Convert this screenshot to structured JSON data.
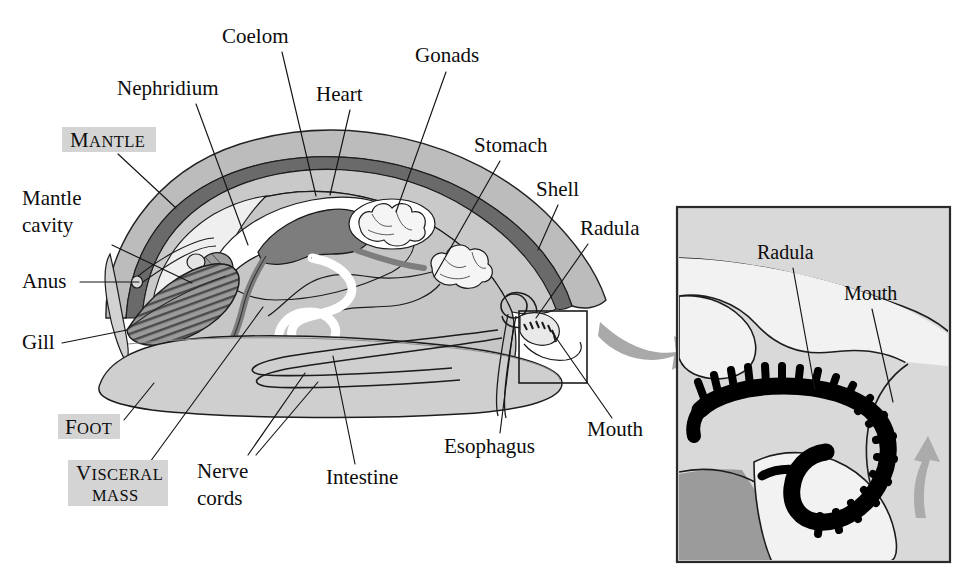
{
  "figure": {
    "background": "#ffffff"
  },
  "palette": {
    "ink": "#141414",
    "shell_band": "#b9b9b9",
    "shell_line": "#6e6e6e",
    "mantle_fill": "#cfcfcf",
    "visceral_fill": "#c6c6c6",
    "foot_fill": "#cfcfcf",
    "cavity_fill": "#ededed",
    "heart_fill": "#7d7d7d",
    "gill_fill": "#9a9a9a",
    "white": "#ffffff",
    "arrow_gray": "#a6a6a6",
    "inset_bg": "#d9d9d9",
    "inset_light": "#f0f0f0",
    "inset_dark": "#9b9b9b",
    "radula_black": "#000000",
    "highlight_box": "#d4d4d4"
  },
  "main_diagram": {
    "name": "mollusc-cutaway",
    "labels": [
      {
        "id": "coelom",
        "text": "Coelom",
        "x": 222,
        "y": 43,
        "anchor": "start",
        "leader": [
          [
            282,
            52
          ],
          [
            316,
            196
          ]
        ]
      },
      {
        "id": "nephridium",
        "text": "Nephridium",
        "x": 117,
        "y": 95,
        "anchor": "start",
        "leader": [
          [
            196,
            104
          ],
          [
            248,
            245
          ]
        ]
      },
      {
        "id": "heart",
        "text": "Heart",
        "x": 316,
        "y": 101,
        "anchor": "start",
        "leader": [
          [
            350,
            110
          ],
          [
            330,
            195
          ]
        ]
      },
      {
        "id": "gonads",
        "text": "Gonads",
        "x": 415,
        "y": 62,
        "anchor": "start",
        "leader": [
          [
            446,
            72
          ],
          [
            396,
            212
          ]
        ]
      },
      {
        "id": "stomach",
        "text": "Stomach",
        "x": 474,
        "y": 152,
        "anchor": "start",
        "leader": [
          [
            500,
            161
          ],
          [
            434,
            277
          ]
        ]
      },
      {
        "id": "shell",
        "text": "Shell",
        "x": 536,
        "y": 196,
        "anchor": "start",
        "leader": [
          [
            558,
            205
          ],
          [
            538,
            250
          ]
        ]
      },
      {
        "id": "radula",
        "text": "Radula",
        "x": 580,
        "y": 235,
        "anchor": "start",
        "leader": [
          [
            588,
            244
          ],
          [
            536,
            318
          ]
        ]
      },
      {
        "id": "mantle_cavity",
        "text": "Mantle",
        "text2": "cavity",
        "x": 22,
        "y": 205,
        "anchor": "start",
        "leader": [
          [
            112,
            245
          ],
          [
            192,
            283
          ]
        ]
      },
      {
        "id": "anus",
        "text": "Anus",
        "x": 22,
        "y": 288,
        "anchor": "start",
        "leader": [
          [
            80,
            282
          ],
          [
            136,
            282
          ]
        ]
      },
      {
        "id": "gill",
        "text": "Gill",
        "x": 22,
        "y": 349,
        "anchor": "start",
        "leader": [
          [
            62,
            343
          ],
          [
            126,
            329
          ]
        ]
      },
      {
        "id": "nerve_cords",
        "text": "Nerve",
        "text2": "cords",
        "x": 197,
        "y": 478,
        "anchor": "start",
        "leader": [
          [
            248,
            455
          ],
          [
            305,
            375
          ]
        ]
      },
      {
        "id": "intestine",
        "text": "Intestine",
        "x": 326,
        "y": 484,
        "anchor": "start",
        "leader": [
          [
            355,
            464
          ],
          [
            333,
            358
          ]
        ]
      },
      {
        "id": "esophagus",
        "text": "Esophagus",
        "x": 444,
        "y": 453,
        "anchor": "start",
        "leader": [
          [
            500,
            433
          ],
          [
            516,
            323
          ]
        ]
      },
      {
        "id": "mouth",
        "text": "Mouth",
        "x": 587,
        "y": 436,
        "anchor": "start",
        "leader": [
          [
            612,
            418
          ],
          [
            548,
            330
          ]
        ]
      }
    ],
    "region_labels": [
      {
        "id": "mantle",
        "lines": [
          "MANTLE"
        ],
        "box": {
          "x": 62,
          "y": 127,
          "w": 94,
          "h": 25
        },
        "leader": [
          [
            118,
            154
          ],
          [
            175,
            208
          ]
        ]
      },
      {
        "id": "foot",
        "lines": [
          "FOOT"
        ],
        "box": {
          "x": 58,
          "y": 414,
          "w": 62,
          "h": 25
        },
        "leader": [
          [
            122,
            420
          ],
          [
            152,
            383
          ]
        ]
      },
      {
        "id": "visceral_mass",
        "lines": [
          "VISCERAL",
          "MASS"
        ],
        "box": {
          "x": 68,
          "y": 460,
          "w": 100,
          "h": 46
        },
        "leader": [
          [
            147,
            463
          ],
          [
            263,
            307
          ]
        ]
      }
    ]
  },
  "inset": {
    "name": "radula-detail",
    "frame": {
      "x": 677,
      "y": 207,
      "w": 273,
      "h": 355
    },
    "labels": [
      {
        "id": "inset_radula",
        "text": "Radula",
        "x": 757,
        "y": 259,
        "anchor": "start",
        "leader": [
          [
            793,
            268
          ],
          [
            815,
            390
          ]
        ]
      },
      {
        "id": "inset_mouth",
        "text": "Mouth",
        "x": 844,
        "y": 300,
        "anchor": "start",
        "leader": [
          [
            872,
            309
          ],
          [
            890,
            400
          ]
        ]
      }
    ],
    "motion_arrow": {
      "id": "radula-motion-arrow",
      "direction": "up"
    }
  },
  "connector_arrow": {
    "id": "zoom-connector-arrow",
    "from": [
      603,
      330
    ],
    "to": [
      700,
      345
    ],
    "description": "curved gray arrow pointing from boxed mouth region to inset"
  },
  "source_box": {
    "x": 519,
    "y": 311,
    "w": 68,
    "h": 72
  }
}
